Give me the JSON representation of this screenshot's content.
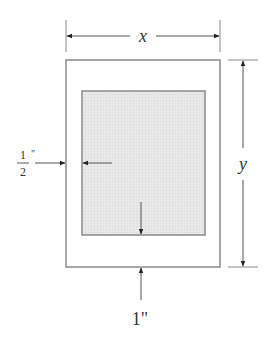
{
  "diagram": {
    "title": "",
    "labels": {
      "width": "x",
      "height": "y",
      "side_margin_num": "1",
      "side_margin_den": "2",
      "side_margin_unit": "\"",
      "bottom_margin": "1\""
    },
    "colors": {
      "line": "#8a8a8a",
      "arrow": "#222222",
      "inner_fill": "#e6e6e6",
      "text": "#333333"
    },
    "shapes": {
      "outer_rect": {
        "x": 66,
        "y": 60,
        "w": 154,
        "h": 207
      },
      "inner_rect": {
        "x": 82,
        "y": 91,
        "w": 123,
        "h": 144
      }
    }
  }
}
